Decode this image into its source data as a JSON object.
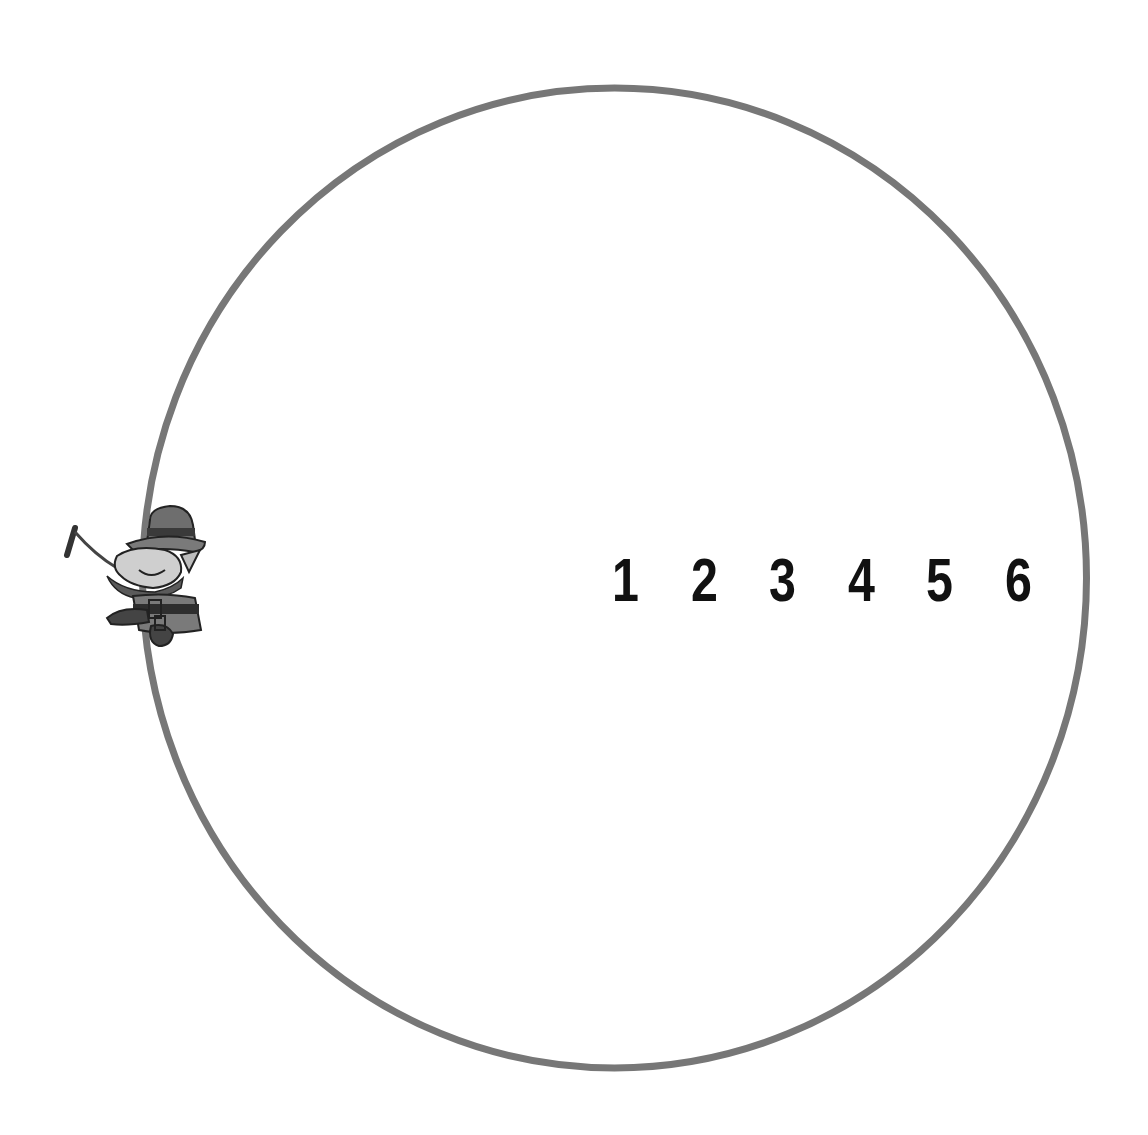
{
  "diagram": {
    "circle": {
      "stroke_color": "#777777",
      "stroke_width": 7,
      "cx": 615,
      "cy": 578,
      "r": 470
    },
    "numbers": [
      "1",
      "2",
      "3",
      "4",
      "5",
      "6"
    ],
    "figure": {
      "name": "leprechaun",
      "position": "left edge of circle",
      "holds": "pipe"
    }
  }
}
